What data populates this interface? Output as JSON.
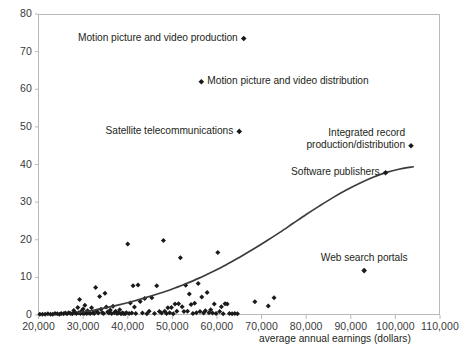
{
  "chart_data": {
    "type": "scatter",
    "title": "",
    "subtitle": "",
    "xlabel": "average annual earnings  (dollars)",
    "ylabel": "",
    "xlim": [
      20000,
      110000
    ],
    "ylim": [
      0,
      80
    ],
    "grid": false,
    "legend": "none",
    "xticks": [
      "20,000",
      "30,000",
      "40,000",
      "50,000",
      "60,000",
      "70,000",
      "80,000",
      "90,000",
      "100,000",
      "110,000"
    ],
    "xtick_values": [
      20000,
      30000,
      40000,
      50000,
      60000,
      70000,
      80000,
      90000,
      100000,
      110000
    ],
    "yticks": [
      "0",
      "10",
      "20",
      "30",
      "40",
      "50",
      "60",
      "70",
      "80"
    ],
    "ytick_values": [
      0,
      10,
      20,
      30,
      40,
      50,
      60,
      70,
      80
    ],
    "marker": "diamond",
    "marker_color": "#1a1a1a",
    "trendline": {
      "color": "#3c3c3c",
      "points": [
        [
          29000,
          0.7
        ],
        [
          32000,
          1.2
        ],
        [
          35000,
          1.9
        ],
        [
          38000,
          2.7
        ],
        [
          41000,
          3.6
        ],
        [
          44000,
          4.6
        ],
        [
          47000,
          5.7
        ],
        [
          50000,
          6.9
        ],
        [
          53000,
          8.3
        ],
        [
          56000,
          9.8
        ],
        [
          59000,
          11.5
        ],
        [
          62000,
          13.3
        ],
        [
          65000,
          15.3
        ],
        [
          68000,
          17.4
        ],
        [
          71000,
          19.6
        ],
        [
          74000,
          21.9
        ],
        [
          77000,
          24.3
        ],
        [
          80000,
          26.7
        ],
        [
          83000,
          29.0
        ],
        [
          86000,
          31.2
        ],
        [
          89000,
          33.2
        ],
        [
          92000,
          35.0
        ],
        [
          95000,
          36.6
        ],
        [
          98000,
          37.9
        ],
        [
          101000,
          38.8
        ],
        [
          104000,
          39.4
        ]
      ]
    },
    "labeled_points": [
      {
        "label": "Motion picture and video production",
        "x": 66000,
        "y": 73.5,
        "label_side": "left"
      },
      {
        "label": "Motion picture and video distribution",
        "x": 56500,
        "y": 62.0,
        "label_side": "right"
      },
      {
        "label": "Satellite telecommunications",
        "x": 65000,
        "y": 48.8,
        "label_side": "left"
      },
      {
        "label": "Integrated record production/distribution",
        "x": 103500,
        "y": 45.0,
        "label_side": "left-two-line"
      },
      {
        "label": "Software publishers",
        "x": 97800,
        "y": 37.8,
        "label_side": "left"
      },
      {
        "label": "Web search portals",
        "x": 93000,
        "y": 11.8,
        "label_side": "above"
      }
    ],
    "points": [
      [
        20300,
        0.2
      ],
      [
        20900,
        0.2
      ],
      [
        21500,
        0.2
      ],
      [
        22100,
        0.3
      ],
      [
        22700,
        0.2
      ],
      [
        23200,
        0.2
      ],
      [
        23700,
        0.4
      ],
      [
        24200,
        0.3
      ],
      [
        24700,
        0.2
      ],
      [
        25100,
        0.4
      ],
      [
        25600,
        0.3
      ],
      [
        26000,
        0.5
      ],
      [
        26400,
        0.3
      ],
      [
        26800,
        0.6
      ],
      [
        27200,
        0.4
      ],
      [
        27600,
        0.3
      ],
      [
        27900,
        1.2
      ],
      [
        28200,
        0.5
      ],
      [
        28500,
        0.4
      ],
      [
        28800,
        2.0
      ],
      [
        29000,
        0.6
      ],
      [
        29200,
        4.1
      ],
      [
        29400,
        0.4
      ],
      [
        29600,
        1.0
      ],
      [
        29800,
        0.5
      ],
      [
        30000,
        1.6
      ],
      [
        30200,
        0.4
      ],
      [
        30400,
        2.6
      ],
      [
        30600,
        0.6
      ],
      [
        30800,
        0.4
      ],
      [
        31000,
        1.1
      ],
      [
        31300,
        0.5
      ],
      [
        31600,
        0.4
      ],
      [
        31900,
        1.9
      ],
      [
        32200,
        0.6
      ],
      [
        32500,
        0.4
      ],
      [
        32800,
        7.3
      ],
      [
        33100,
        1.0
      ],
      [
        33400,
        0.5
      ],
      [
        33700,
        4.9
      ],
      [
        34000,
        1.5
      ],
      [
        34300,
        0.6
      ],
      [
        34600,
        0.4
      ],
      [
        34900,
        5.8
      ],
      [
        35200,
        2.1
      ],
      [
        35500,
        0.8
      ],
      [
        35800,
        0.5
      ],
      [
        36100,
        1.3
      ],
      [
        36400,
        0.4
      ],
      [
        36700,
        2.3
      ],
      [
        37000,
        0.6
      ],
      [
        37300,
        1.0
      ],
      [
        37600,
        0.4
      ],
      [
        37900,
        0.5
      ],
      [
        38200,
        1.4
      ],
      [
        38500,
        0.3
      ],
      [
        38800,
        0.5
      ],
      [
        39100,
        0.4
      ],
      [
        39400,
        0.3
      ],
      [
        39700,
        0.6
      ],
      [
        40000,
        18.9
      ],
      [
        40300,
        0.4
      ],
      [
        40600,
        3.2
      ],
      [
        40900,
        0.5
      ],
      [
        41200,
        7.8
      ],
      [
        41500,
        2.1
      ],
      [
        41800,
        0.4
      ],
      [
        42300,
        8.0
      ],
      [
        42800,
        3.6
      ],
      [
        43300,
        0.5
      ],
      [
        43800,
        4.4
      ],
      [
        44300,
        0.3
      ],
      [
        44800,
        1.0
      ],
      [
        45400,
        4.6
      ],
      [
        46000,
        0.4
      ],
      [
        46500,
        7.8
      ],
      [
        47100,
        0.9
      ],
      [
        47600,
        0.5
      ],
      [
        48000,
        19.8
      ],
      [
        48300,
        1.0
      ],
      [
        48700,
        0.4
      ],
      [
        49000,
        1.9
      ],
      [
        49400,
        0.6
      ],
      [
        49800,
        2.0
      ],
      [
        50200,
        0.3
      ],
      [
        50600,
        2.9
      ],
      [
        51000,
        1.0
      ],
      [
        51400,
        3.0
      ],
      [
        51800,
        15.2
      ],
      [
        52200,
        2.2
      ],
      [
        52600,
        0.9
      ],
      [
        53000,
        7.9
      ],
      [
        53400,
        1.0
      ],
      [
        53800,
        5.6
      ],
      [
        54200,
        2.8
      ],
      [
        54600,
        0.4
      ],
      [
        55000,
        3.1
      ],
      [
        55400,
        0.6
      ],
      [
        55800,
        8.4
      ],
      [
        56200,
        0.9
      ],
      [
        56600,
        4.8
      ],
      [
        57000,
        0.5
      ],
      [
        57400,
        1.1
      ],
      [
        57800,
        6.0
      ],
      [
        58200,
        0.6
      ],
      [
        58600,
        1.4
      ],
      [
        59000,
        0.5
      ],
      [
        59400,
        2.9
      ],
      [
        59800,
        0.4
      ],
      [
        60200,
        16.6
      ],
      [
        60600,
        0.9
      ],
      [
        61000,
        2.2
      ],
      [
        61400,
        0.3
      ],
      [
        61800,
        3.0
      ],
      [
        62300,
        2.9
      ],
      [
        62800,
        0.4
      ],
      [
        63400,
        0.3
      ],
      [
        64000,
        0.4
      ],
      [
        64600,
        0.3
      ],
      [
        68500,
        3.5
      ],
      [
        71500,
        2.4
      ],
      [
        72800,
        4.6
      ]
    ]
  },
  "axis_label": {
    "text": "average annual earnings  (dollars)"
  }
}
